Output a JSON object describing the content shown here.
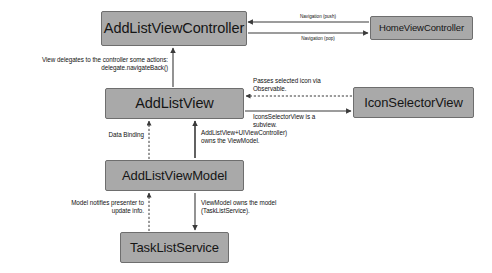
{
  "diagram": {
    "colors": {
      "node_fill": "#a9a9a9",
      "node_border": "#6e6e6e",
      "text": "#151515",
      "edge": "#3a3a3a",
      "background": "#ffffff"
    },
    "nodes": [
      {
        "id": "add_list_view_controller",
        "label": "AddListViewController"
      },
      {
        "id": "home_view_controller",
        "label": "HomeViewController"
      },
      {
        "id": "add_list_view",
        "label": "AddListView"
      },
      {
        "id": "icon_selector_view",
        "label": "IconSelectorView"
      },
      {
        "id": "add_list_view_model",
        "label": "AddListViewModel"
      },
      {
        "id": "task_list_service",
        "label": "TaskListService"
      }
    ],
    "edges": [
      {
        "id": "navigation_push",
        "from": "home_view_controller",
        "to": "add_list_view_controller",
        "label": "Navigation (push)",
        "style": "solid"
      },
      {
        "id": "navigation_pop",
        "from": "add_list_view_controller",
        "to": "home_view_controller",
        "label": "Navigation (pop)",
        "style": "solid"
      },
      {
        "id": "view_delegates",
        "from": "add_list_view",
        "to": "add_list_view_controller",
        "label": "View delegates to the controller some actions:\ndelegate.navigateBack()",
        "style": "solid"
      },
      {
        "id": "passes_selected_icon",
        "from": "icon_selector_view",
        "to": "add_list_view",
        "label": "Passes selected icon via\nObservable.",
        "style": "dashed"
      },
      {
        "id": "is_subview",
        "from": "add_list_view",
        "to": "icon_selector_view",
        "label": "IconsSelectorView is a\nsubview.",
        "style": "solid"
      },
      {
        "id": "data_binding",
        "from": "add_list_view_model",
        "to": "add_list_view",
        "label": "Data Binding",
        "style": "dashed"
      },
      {
        "id": "owns_view_model",
        "from": "add_list_view",
        "to": "add_list_view_model",
        "label": "AddListView+UIViewController)\nowns the ViewModel.",
        "style": "solid"
      },
      {
        "id": "model_notifies_presenter",
        "from": "task_list_service",
        "to": "add_list_view_model",
        "label": "Model notifies presenter  to\nupdate info.",
        "style": "dashed"
      },
      {
        "id": "view_model_owns_model",
        "from": "add_list_view_model",
        "to": "task_list_service",
        "label": "ViewModel owns the model\n(TaskListService).",
        "style": "solid"
      }
    ]
  }
}
